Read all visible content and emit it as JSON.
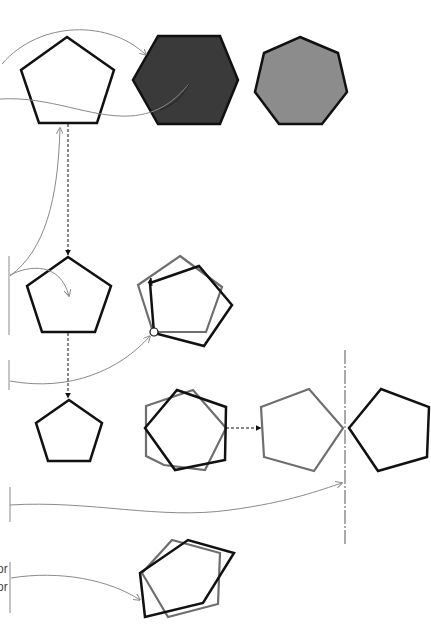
{
  "diagram": {
    "title": "",
    "colors": {
      "background": "#ffffff",
      "outline_dark": "#111111",
      "outline_gray": "#6e6e6e",
      "connector": "#8a8a8a",
      "fill_dark": "#3a3a3a",
      "fill_mid": "#8c8c8c"
    },
    "sections": [
      {
        "id": "fill",
        "description": "Pentagon, dark-filled hexagon, gray-filled heptagon"
      },
      {
        "id": "rotate",
        "description": "Pentagon and rotated pentagon about a pivot point"
      },
      {
        "id": "scale-reflect",
        "description": "Small pentagon, rotated overlapping pentagons, reflection across vertical mirror axis"
      },
      {
        "id": "skew",
        "description": "Skewed overlapping pentagons"
      }
    ],
    "clipped_labels": [
      {
        "text": "or",
        "x": 0,
        "y": 563
      },
      {
        "text": "or",
        "x": 0,
        "y": 581
      }
    ]
  }
}
